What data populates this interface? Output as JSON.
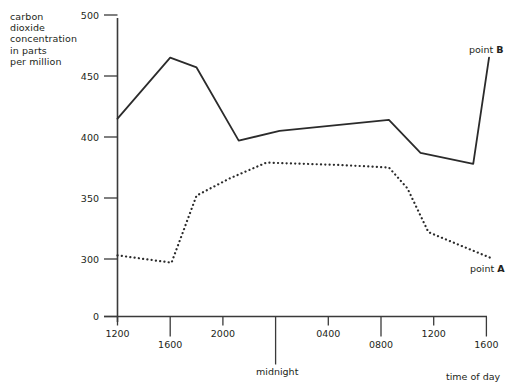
{
  "chart_data": {
    "type": "line",
    "title": "",
    "ylabel": "carbon dioxide concentration in parts per million",
    "ylabel_lines": [
      "carbon",
      "dioxide",
      "concentration",
      "in parts",
      "per million"
    ],
    "xlabel": "time of day",
    "x_tick_labels": [
      "1200",
      "1600",
      "2000",
      "midnight",
      "0400",
      "0800",
      "1200",
      "1600"
    ],
    "x_tick_values": [
      1200,
      1600,
      2000,
      2400,
      2800,
      3200,
      3600,
      4000
    ],
    "y_tick_labels": [
      "0",
      "300",
      "350",
      "400",
      "450",
      "500"
    ],
    "y_tick_values": [
      0,
      300,
      350,
      400,
      450,
      500
    ],
    "ylim": [
      0,
      500
    ],
    "y_axis_break": true,
    "grid": false,
    "legend_position": "inline-end-of-line",
    "annotations": [
      {
        "text": "point B",
        "bold_part": "B",
        "series": "point B"
      },
      {
        "text": "point A",
        "bold_part": "A",
        "series": "point A"
      },
      {
        "text": "midnight",
        "axis": "x"
      },
      {
        "text": "time of day",
        "axis": "x"
      }
    ],
    "series": [
      {
        "name": "point B",
        "style": "solid",
        "color": "#2b2b2b",
        "points": [
          {
            "x": 1200,
            "y": 415
          },
          {
            "x": 1600,
            "y": 465
          },
          {
            "x": 1800,
            "y": 457
          },
          {
            "x": 2120,
            "y": 397
          },
          {
            "x": 2430,
            "y": 405
          },
          {
            "x": 3260,
            "y": 414
          },
          {
            "x": 3500,
            "y": 387
          },
          {
            "x": 3900,
            "y": 378
          },
          {
            "x": 4020,
            "y": 465
          }
        ]
      },
      {
        "name": "point A",
        "style": "dotted",
        "color": "#2b2b2b",
        "points": [
          {
            "x": 1200,
            "y": 303
          },
          {
            "x": 1610,
            "y": 297
          },
          {
            "x": 1800,
            "y": 352
          },
          {
            "x": 2050,
            "y": 366
          },
          {
            "x": 2330,
            "y": 379
          },
          {
            "x": 2900,
            "y": 377
          },
          {
            "x": 3260,
            "y": 375
          },
          {
            "x": 3400,
            "y": 358
          },
          {
            "x": 3560,
            "y": 322
          },
          {
            "x": 3760,
            "y": 313
          },
          {
            "x": 4030,
            "y": 301
          }
        ]
      }
    ]
  }
}
